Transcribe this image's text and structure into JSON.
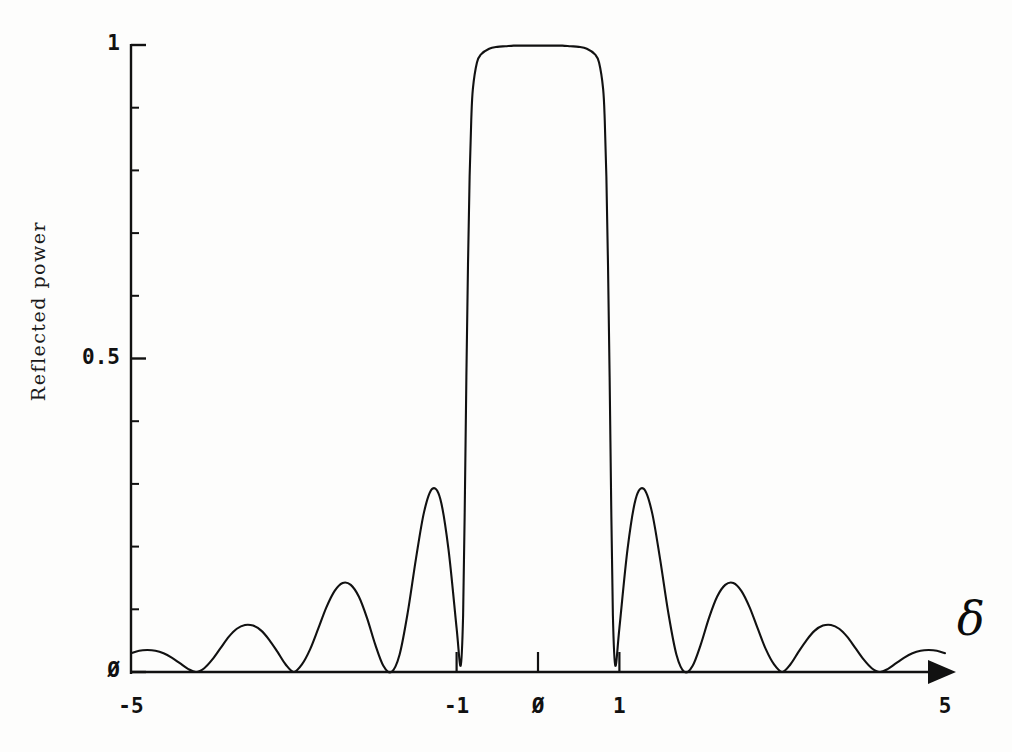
{
  "figure": {
    "kind": "scientific-plot",
    "background_color": "#fdfdfc",
    "ink_color": "#111111"
  },
  "axes": {
    "y_label": "Reflected power",
    "x_symbol": "δ",
    "y_ticks": [
      {
        "value": 1,
        "label": "1"
      },
      {
        "value": 0.5,
        "label": "0.5"
      },
      {
        "value": 0,
        "label": "Ø"
      }
    ],
    "y_minor_step": 0.1,
    "x_ticks": [
      {
        "value": -5,
        "label": "-5"
      },
      {
        "value": -1,
        "label": "-1"
      },
      {
        "value": 0,
        "label": "Ø"
      },
      {
        "value": 1,
        "label": "1"
      },
      {
        "value": 5,
        "label": "5"
      }
    ],
    "x_arrow": true
  },
  "chart_data": {
    "type": "line",
    "title": "",
    "subtitle": "",
    "xlabel": "δ",
    "ylabel": "Reflected power",
    "xlim": [
      -5,
      5
    ],
    "ylim": [
      0,
      1
    ],
    "grid": false,
    "legend": null,
    "series": [
      {
        "name": "Reflected power",
        "color": "#111111",
        "x": [
          -5.0,
          -4.9,
          -4.8,
          -4.7,
          -4.6,
          -4.5,
          -4.4,
          -4.3,
          -4.2,
          -4.1,
          -4.0,
          -3.9,
          -3.8,
          -3.7,
          -3.6,
          -3.5,
          -3.4,
          -3.3,
          -3.2,
          -3.1,
          -3.0,
          -2.9,
          -2.8,
          -2.7,
          -2.6,
          -2.5,
          -2.4,
          -2.3,
          -2.2,
          -2.1,
          -2.0,
          -1.9,
          -1.8,
          -1.7,
          -1.6,
          -1.5,
          -1.4,
          -1.3,
          -1.2,
          -1.1,
          -1.0,
          -0.95,
          -0.92,
          -0.9,
          -0.88,
          -0.86,
          -0.84,
          -0.82,
          -0.8,
          -0.75,
          -0.7,
          -0.6,
          -0.5,
          -0.4,
          -0.3,
          -0.2,
          -0.1,
          0.0,
          0.1,
          0.2,
          0.3,
          0.4,
          0.5,
          0.6,
          0.7,
          0.75,
          0.8,
          0.82,
          0.84,
          0.86,
          0.88,
          0.9,
          0.92,
          0.95,
          1.0,
          1.1,
          1.2,
          1.3,
          1.4,
          1.5,
          1.6,
          1.7,
          1.8,
          1.9,
          2.0,
          2.1,
          2.2,
          2.3,
          2.4,
          2.5,
          2.6,
          2.7,
          2.8,
          2.9,
          3.0,
          3.1,
          3.2,
          3.3,
          3.4,
          3.5,
          3.6,
          3.7,
          3.8,
          3.9,
          4.0,
          4.1,
          4.2,
          4.3,
          4.4,
          4.5,
          4.6,
          4.7,
          4.8,
          4.9,
          5.0
        ],
        "y": [
          0.03,
          0.034,
          0.035,
          0.034,
          0.03,
          0.023,
          0.014,
          0.005,
          0.0,
          0.006,
          0.02,
          0.038,
          0.056,
          0.069,
          0.075,
          0.074,
          0.066,
          0.051,
          0.032,
          0.012,
          0.0,
          0.012,
          0.036,
          0.069,
          0.103,
          0.129,
          0.142,
          0.139,
          0.12,
          0.086,
          0.044,
          0.01,
          0.0,
          0.028,
          0.095,
          0.18,
          0.255,
          0.292,
          0.276,
          0.196,
          0.07,
          0.01,
          0.09,
          0.26,
          0.47,
          0.65,
          0.79,
          0.88,
          0.93,
          0.972,
          0.985,
          0.994,
          0.997,
          0.998,
          0.999,
          0.999,
          0.999,
          0.999,
          0.999,
          0.999,
          0.999,
          0.998,
          0.997,
          0.994,
          0.985,
          0.972,
          0.93,
          0.88,
          0.79,
          0.65,
          0.47,
          0.26,
          0.09,
          0.01,
          0.07,
          0.196,
          0.276,
          0.292,
          0.255,
          0.18,
          0.095,
          0.028,
          0.0,
          0.01,
          0.044,
          0.086,
          0.12,
          0.139,
          0.142,
          0.129,
          0.103,
          0.069,
          0.036,
          0.012,
          0.0,
          0.012,
          0.032,
          0.051,
          0.066,
          0.074,
          0.075,
          0.069,
          0.056,
          0.038,
          0.02,
          0.006,
          0.0,
          0.005,
          0.014,
          0.023,
          0.03,
          0.034,
          0.035,
          0.034,
          0.03
        ]
      }
    ],
    "features": {
      "main_band_plateau_value": 1.0,
      "main_band_range": [
        -0.9,
        0.9
      ],
      "nulls": [
        -4.2,
        -3.0,
        -1.8,
        -0.98,
        0.98,
        1.8,
        3.0,
        4.2
      ],
      "sidelobe_peaks": [
        {
          "x": -1.15,
          "y": 0.292
        },
        {
          "x": -2.38,
          "y": 0.142
        },
        {
          "x": -3.58,
          "y": 0.075
        },
        {
          "x": -4.78,
          "y": 0.035
        },
        {
          "x": 1.15,
          "y": 0.292
        },
        {
          "x": 2.38,
          "y": 0.142
        },
        {
          "x": 3.58,
          "y": 0.075
        },
        {
          "x": 4.78,
          "y": 0.035
        }
      ]
    }
  }
}
